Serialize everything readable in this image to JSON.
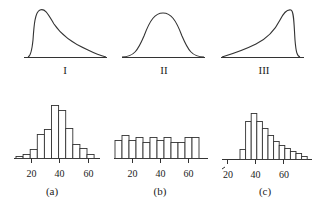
{
  "chart_data": [
    {
      "type": "line",
      "id": "curve-I",
      "label": "I",
      "description": "Right-skewed density curve",
      "skew": "right"
    },
    {
      "type": "line",
      "id": "curve-II",
      "label": "II",
      "description": "Symmetric bell-shaped density curve",
      "skew": "none"
    },
    {
      "type": "line",
      "id": "curve-III",
      "label": "III",
      "description": "Left-skewed density curve",
      "skew": "left"
    },
    {
      "type": "bar",
      "id": "hist-a",
      "label": "(a)",
      "xticks": [
        "20",
        "40",
        "60"
      ],
      "bin_width": 5,
      "bin_start": 10,
      "values": [
        2,
        4,
        9,
        24,
        29,
        53,
        48,
        30,
        14,
        10,
        4
      ]
    },
    {
      "type": "bar",
      "id": "hist-b",
      "label": "(b)",
      "xticks": [
        "20",
        "40",
        "60"
      ],
      "bin_width": 5,
      "bin_start": 10,
      "values": [
        18,
        23,
        18,
        21,
        16,
        21,
        18,
        21,
        16,
        16,
        21,
        21
      ]
    },
    {
      "type": "bar",
      "id": "hist-c",
      "label": "(c)",
      "xticks": [
        "20",
        "40",
        "60"
      ],
      "bin_width": 4,
      "bin_start": 28,
      "values": [
        10,
        38,
        46,
        38,
        31,
        24,
        18,
        14,
        11,
        8,
        6,
        3
      ]
    }
  ],
  "labels": {
    "curve_I": "I",
    "curve_II": "II",
    "curve_III": "III",
    "hist_a": "(a)",
    "hist_b": "(b)",
    "hist_c": "(c)",
    "tick_20": "20",
    "tick_40": "40",
    "tick_60": "60"
  }
}
